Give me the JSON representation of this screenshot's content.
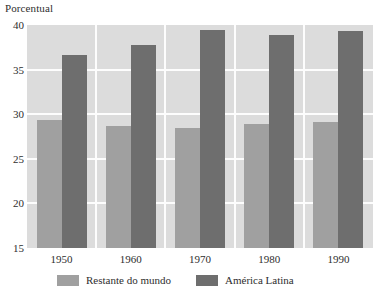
{
  "chart_data": {
    "type": "bar",
    "title": "",
    "ylabel": "Porcentual",
    "xlabel": "",
    "categories": [
      "1950",
      "1960",
      "1970",
      "1980",
      "1990"
    ],
    "series": [
      {
        "name": "Restante do mundo",
        "color": "#a0a0a0",
        "values": [
          29.3,
          28.7,
          28.4,
          28.9,
          29.1
        ]
      },
      {
        "name": "América Latina",
        "color": "#6e6e6e",
        "values": [
          36.6,
          37.8,
          39.4,
          38.9,
          39.3
        ]
      }
    ],
    "ylim": [
      15,
      40
    ],
    "yticks": [
      "40",
      "35",
      "30",
      "25",
      "20",
      "15"
    ],
    "ytick_values": [
      40,
      35,
      30,
      25,
      20,
      15
    ],
    "grid": true,
    "grid_color": "#fdfdfd",
    "plot_background": "#dcdcdc",
    "legend_position": "bottom"
  },
  "legend": {
    "entries": [
      {
        "label": "Restante do mundo",
        "color": "#a0a0a0"
      },
      {
        "label": "América Latina",
        "color": "#6e6e6e"
      }
    ]
  }
}
